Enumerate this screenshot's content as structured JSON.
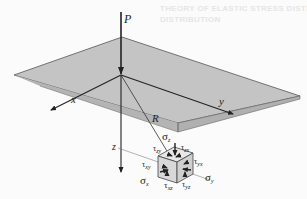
{
  "figure": {
    "bleed_through_text": [
      "THEORY OF ELASTIC STRESS DISTRIBUTION",
      "DISTRIBUTION"
    ],
    "labels": {
      "load": "P",
      "x_axis": "x",
      "y_axis": "y",
      "z_axis": "z",
      "radius": "R",
      "sigma_z": "σ",
      "sigma_z_sub": "z",
      "sigma_x": "σ",
      "sigma_x_sub": "x",
      "sigma_y": "σ",
      "sigma_y_sub": "y",
      "tau_zx": "τ",
      "tau_zx_sub": "zx",
      "tau_zy": "τ",
      "tau_zy_sub": "zy",
      "tau_xy": "τ",
      "tau_xy_sub": "xy",
      "tau_yx": "τ",
      "tau_yx_sub": "yx",
      "tau_xz": "τ",
      "tau_xz_sub": "xz",
      "tau_yz": "τ",
      "tau_yz_sub": "yz"
    },
    "colors": {
      "plane_fill": "#c4c4c4",
      "plane_edge": "#555555",
      "line": "#222222",
      "background": "#fbfbfb"
    }
  }
}
